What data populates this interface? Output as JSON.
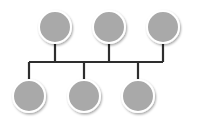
{
  "diagram": {
    "line_color": "#2e2e2e",
    "node_fill": "#a9a9a9",
    "node_stroke": "#ffffff",
    "bus": {
      "y": 62,
      "x1": 29,
      "x2": 163
    },
    "top_nodes": [
      {
        "cx": 55,
        "cy": 27,
        "r": 16
      },
      {
        "cx": 109,
        "cy": 27,
        "r": 16
      },
      {
        "cx": 163,
        "cy": 27,
        "r": 16
      }
    ],
    "bottom_nodes": [
      {
        "cx": 29,
        "cy": 96,
        "r": 16
      },
      {
        "cx": 84,
        "cy": 96,
        "r": 16
      },
      {
        "cx": 138,
        "cy": 96,
        "r": 16
      }
    ]
  }
}
